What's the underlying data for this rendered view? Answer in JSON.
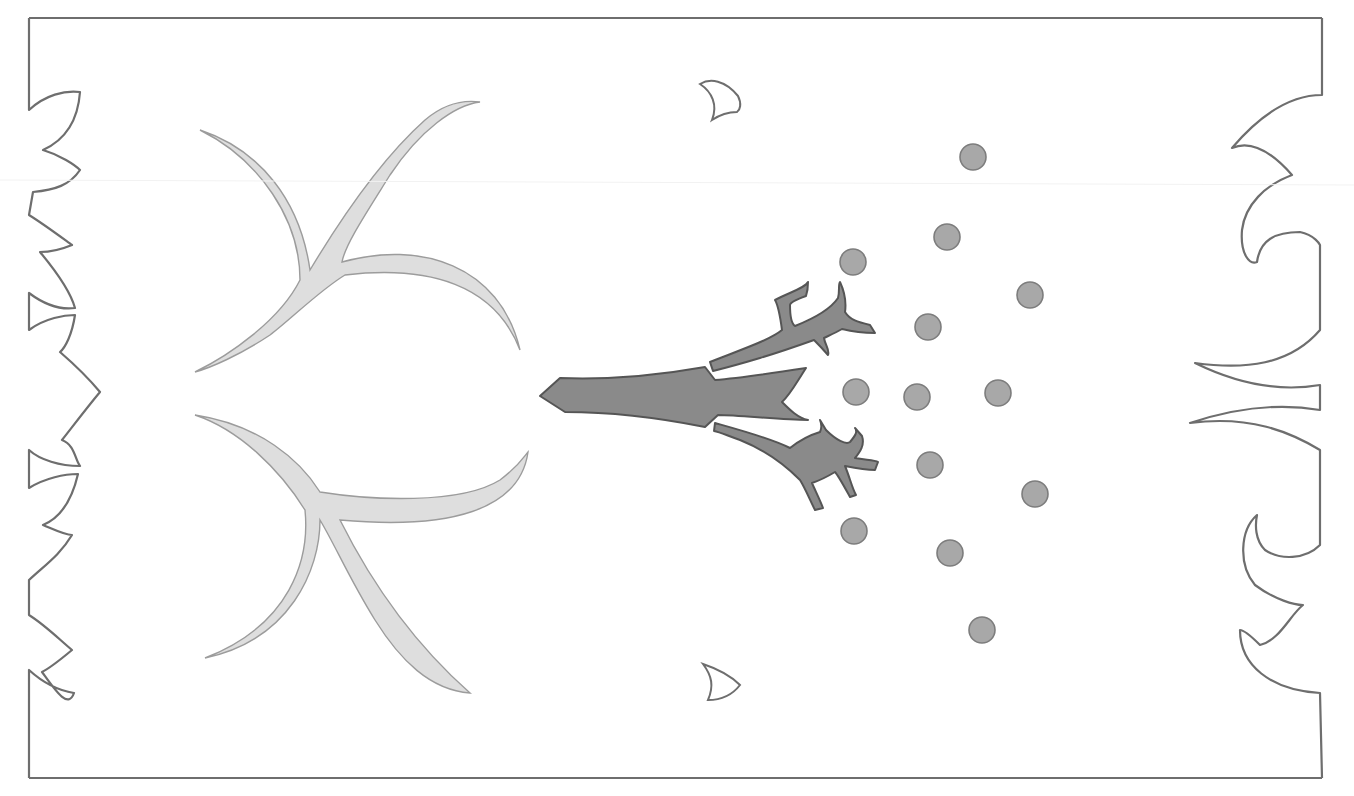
{
  "artwork": {
    "description": "Line-art pattern design in grayscale",
    "colors": {
      "frame": "#6e6e6e",
      "antler_fill": "#dedede",
      "antler_stroke": "#9c9c9c",
      "trunk_fill": "#8a8a8a",
      "trunk_stroke": "#555555",
      "dot_fill": "#a8a8a8",
      "dot_stroke": "#7d7d7d",
      "background": "#ffffff"
    },
    "frame": {
      "left": 29,
      "top": 18,
      "right": 1322,
      "bottom": 778
    },
    "dots": [
      {
        "cx": 973,
        "cy": 157
      },
      {
        "cx": 947,
        "cy": 237
      },
      {
        "cx": 853,
        "cy": 262
      },
      {
        "cx": 1030,
        "cy": 295
      },
      {
        "cx": 928,
        "cy": 327
      },
      {
        "cx": 856,
        "cy": 392
      },
      {
        "cx": 917,
        "cy": 397
      },
      {
        "cx": 998,
        "cy": 393
      },
      {
        "cx": 930,
        "cy": 465
      },
      {
        "cx": 1035,
        "cy": 494
      },
      {
        "cx": 854,
        "cy": 531
      },
      {
        "cx": 950,
        "cy": 553
      },
      {
        "cx": 982,
        "cy": 630
      }
    ],
    "dot_radius": 13
  }
}
